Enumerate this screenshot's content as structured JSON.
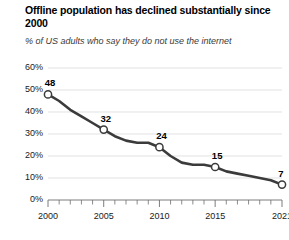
{
  "header": {
    "title": "Offline population has declined substantially since 2000",
    "subtitle": "% of US adults who say they do not use the internet"
  },
  "chart_data": {
    "type": "line",
    "title": "Offline population has declined substantially since 2000",
    "subtitle": "% of US adults who say they do not use the internet",
    "xlabel": "",
    "ylabel": "",
    "xlim": [
      2000,
      2021
    ],
    "ylim": [
      0,
      60
    ],
    "grid": true,
    "legend": "none",
    "line_color": "#3b3b3b",
    "marker_fill": "#ffffff",
    "gridline_color": "#d5d5d5",
    "axis_color": "#6e6e6e",
    "y_ticks": [
      0,
      10,
      20,
      30,
      40,
      50,
      60
    ],
    "y_tick_labels": [
      "0%",
      "10%",
      "20%",
      "30%",
      "40%",
      "50%",
      "60%"
    ],
    "x_ticks": [
      2000,
      2001,
      2002,
      2003,
      2004,
      2005,
      2006,
      2007,
      2008,
      2009,
      2010,
      2011,
      2012,
      2013,
      2014,
      2015,
      2016,
      2017,
      2018,
      2019,
      2020,
      2021
    ],
    "x_tick_labels": [
      "2000",
      "2005",
      "2010",
      "2015",
      "2021"
    ],
    "x_tick_label_years": [
      2000,
      2005,
      2010,
      2015,
      2021
    ],
    "x": [
      2000,
      2001,
      2002,
      2003,
      2004,
      2005,
      2006,
      2007,
      2008,
      2009,
      2010,
      2011,
      2012,
      2013,
      2014,
      2015,
      2016,
      2017,
      2018,
      2019,
      2020,
      2021
    ],
    "values": [
      48,
      45,
      41,
      38,
      35,
      32,
      29,
      27,
      26,
      26,
      24,
      20,
      17,
      16,
      16,
      15,
      13,
      12,
      11,
      10,
      9,
      7
    ],
    "labeled_points": [
      {
        "x": 2000,
        "y": 48,
        "label": "48"
      },
      {
        "x": 2005,
        "y": 32,
        "label": "32"
      },
      {
        "x": 2010,
        "y": 24,
        "label": "24"
      },
      {
        "x": 2015,
        "y": 15,
        "label": "15"
      },
      {
        "x": 2021,
        "y": 7,
        "label": "7"
      }
    ]
  }
}
